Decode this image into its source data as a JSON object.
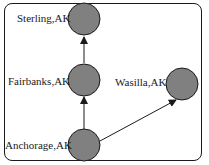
{
  "diagram": {
    "nodes": [
      {
        "id": "sterling",
        "label": "Sterling,AK"
      },
      {
        "id": "fairbanks",
        "label": "Fairbanks,AK"
      },
      {
        "id": "wasilla",
        "label": "Wasilla,AK"
      },
      {
        "id": "anchorage",
        "label": "Anchorage,AK"
      }
    ],
    "edges": [
      {
        "from": "fairbanks",
        "to": "sterling"
      },
      {
        "from": "anchorage",
        "to": "fairbanks"
      },
      {
        "from": "anchorage",
        "to": "wasilla"
      }
    ],
    "colors": {
      "node_fill": "#808080",
      "stroke": "#1a1a1a"
    }
  }
}
